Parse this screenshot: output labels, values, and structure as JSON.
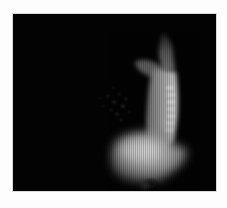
{
  "image": {
    "description": "Grayscale volume-rendered medical scan showing a bright curved spine-like structure descending from upper right and widening into a bright lobe at the bottom, on a black background inside a white border",
    "colors": {
      "background": "#030303",
      "border": "#fdfdfd",
      "highlight": "#d8d8d8",
      "mid": "#8a8a8a",
      "dim": "#3a3a3a"
    },
    "panel": {
      "x": 13,
      "y": 14,
      "width": 203,
      "height": 177
    },
    "features": [
      {
        "name": "upper-branch",
        "cx": 160,
        "cy": 40
      },
      {
        "name": "spine-column",
        "cx": 158,
        "cy": 100
      },
      {
        "name": "bottom-lobe",
        "cx": 135,
        "cy": 150
      },
      {
        "name": "faint-scatter",
        "cx": 105,
        "cy": 95
      }
    ]
  }
}
